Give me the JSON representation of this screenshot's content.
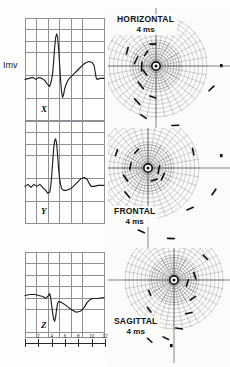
{
  "figure": {
    "type": "vectorcardiogram-figure",
    "background_color": "#fdfdfb",
    "ink_color": "#1d1d1d",
    "grid_color": "#8f8f96"
  },
  "calibration": {
    "label": "Imv",
    "meaning": "1 millivolt amplitude calibration bar"
  },
  "leads": [
    {
      "id": "x",
      "label": "X",
      "name": "scalar-lead-x",
      "grid_columns": 7,
      "grid_rows": 9,
      "waveform": "M0,62 L4,61 L8,60 L11,62 L14,60 L17,61 L20,63 L22,66 L24,68 L25,69 L26,66 L27,62 L28,56 L29,44 L30,30 L31,20 L32,16 L33,19 L34,30 L35,46 L36,62 L37,74 L38,80 L39,78 L40,72 L42,66 L44,62 L47,59 L50,56 L53,53 L56,50 L59,47 L62,45 L65,44 L68,45 L70,48 L71,54 L72,60 L73,62 L76,61 L80,61"
    },
    {
      "id": "y",
      "label": "Y",
      "name": "scalar-lead-y",
      "grid_columns": 7,
      "grid_rows": 9,
      "waveform": "M0,66 L3,64 L6,67 L9,64 L12,66 L15,64 L18,67 L21,70 L23,73 L25,72 L26,66 L27,56 L28,42 L29,28 L30,20 L31,18 L32,22 L33,34 L34,48 L35,58 L36,64 L37,68 L39,70 L42,70 L45,69 L48,67 L51,64 L54,61 L57,58 L60,57 L63,59 L65,63 L67,66 L70,66 L74,65 L80,65"
    },
    {
      "id": "z",
      "label": "Z",
      "name": "scalar-lead-z",
      "grid_columns": 7,
      "grid_rows": 7,
      "waveform": "M0,44 L5,43 L10,43 L14,44 L18,45 L21,47 L24,44 L25,42 L26,46 L27,54 L28,62 L29,68 L30,70 L31,66 L32,58 L33,52 L34,50 L37,51 L40,53 L44,56 L48,59 L52,61 L56,60 L60,56 L63,51 L66,48 L69,47 L73,47 L80,46"
    }
  ],
  "time_axis": {
    "unit": "ms",
    "ticks": [
      {
        "value": "",
        "position": 0
      },
      {
        "value": "2",
        "position": 1
      },
      {
        "value": "4",
        "position": 2
      },
      {
        "value": "6",
        "position": 3
      },
      {
        "value": "8",
        "position": 4
      },
      {
        "value": "10",
        "position": 5
      },
      {
        "value": "12",
        "position": 6
      }
    ]
  },
  "loop_plots": [
    {
      "id": "horizontal",
      "plane_label": "HORIZONTAL",
      "time_label": "4 ms",
      "name": "vector-loop-horizontal",
      "grid_type": "polar",
      "radial_spokes": 36,
      "concentric_rings": 9
    },
    {
      "id": "frontal",
      "plane_label": "FRONTAL",
      "time_label": "4 ms",
      "name": "vector-loop-frontal",
      "grid_type": "polar",
      "radial_spokes": 36,
      "concentric_rings": 9
    },
    {
      "id": "sagittal",
      "plane_label": "SAGITTAL",
      "time_label": "4 ms",
      "name": "vector-loop-sagittal",
      "grid_type": "polar",
      "radial_spokes": 36,
      "concentric_rings": 9
    }
  ]
}
